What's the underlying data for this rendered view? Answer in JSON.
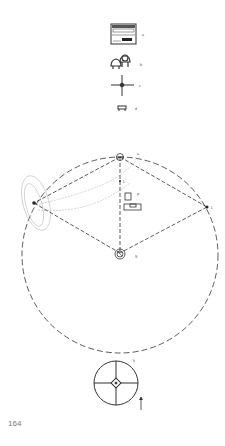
{
  "legend": {
    "items": [
      {
        "key": "a",
        "icon": "equipment-rack-icon"
      },
      {
        "key": "b",
        "icon": "chairs-icon"
      },
      {
        "key": "c",
        "icon": "crosshair-icon"
      },
      {
        "key": "d",
        "icon": "small-table-icon"
      }
    ]
  },
  "diagram": {
    "labels": {
      "top": "a",
      "left_center": "L",
      "right": "L",
      "desk": "P",
      "bottom_speaker": "S"
    }
  },
  "small_diagram": {
    "label_h": "h",
    "label_i": "i"
  },
  "footer": {
    "page_number": "164"
  },
  "colors": {
    "ink": "#333333",
    "light_ink": "#aaaaaa"
  }
}
